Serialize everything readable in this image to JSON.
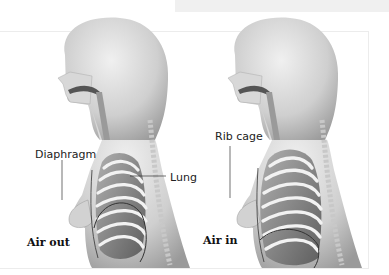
{
  "figure": {
    "panels": [
      {
        "id": "exhale",
        "caption": "Air out",
        "labels": [
          "Diaphragm",
          "Lung"
        ]
      },
      {
        "id": "inhale",
        "caption": "Air in",
        "labels": [
          "Rib cage"
        ]
      }
    ],
    "colors": {
      "skin_light": "#e6e6e6",
      "skin_mid": "#bdbdbd",
      "skin_dark": "#8a8a8a",
      "rib": "#f2f2f2",
      "lung_shadow": "#6e6e6e",
      "outline": "#333333",
      "text": "#222222"
    }
  }
}
